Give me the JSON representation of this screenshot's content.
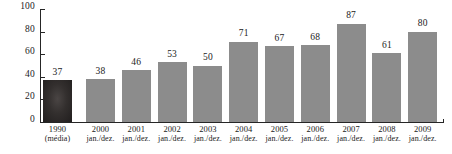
{
  "chart_data": {
    "type": "bar",
    "title": "",
    "xlabel": "",
    "ylabel": "",
    "ylim": [
      0,
      100
    ],
    "yticks": [
      0,
      20,
      40,
      60,
      80,
      100
    ],
    "grid": false,
    "legend": null,
    "categories": [
      "1990",
      "2000",
      "2001",
      "2002",
      "2003",
      "2004",
      "2005",
      "2006",
      "2007",
      "2008",
      "2009"
    ],
    "category_sublabels": [
      "(média)",
      "jan./dez.",
      "jan./dez.",
      "jan./dez.",
      "jan./dez.",
      "jan./dez.",
      "jan./dez.",
      "jan./dez.",
      "jan./dez.",
      "jan./dez.",
      "jan./dez."
    ],
    "values": [
      37,
      38,
      46,
      53,
      50,
      71,
      67,
      68,
      87,
      61,
      80
    ],
    "bar_colors": [
      "#2e2b2b",
      "#8c8c8c",
      "#8c8c8c",
      "#8c8c8c",
      "#8c8c8c",
      "#8c8c8c",
      "#8c8c8c",
      "#8c8c8c",
      "#8c8c8c",
      "#8c8c8c",
      "#8c8c8c"
    ],
    "highlight_index": 0,
    "axis_color": "#262626",
    "background_color": "#ffffff"
  }
}
